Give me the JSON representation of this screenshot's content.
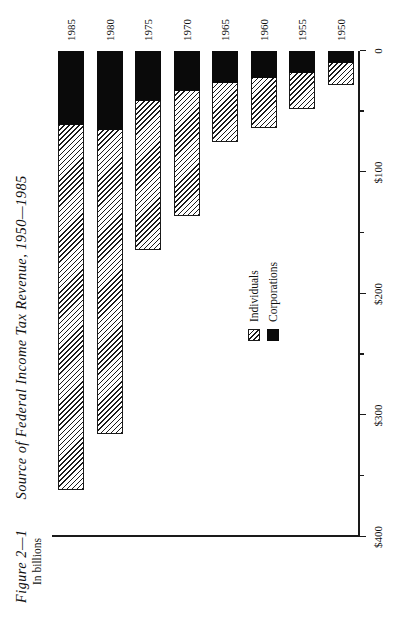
{
  "figure": {
    "number": "Figure 2—1",
    "title": "Source of Federal Income Tax Revenue, 1950—1985",
    "units": "In billions"
  },
  "legend": {
    "position": "inside-left",
    "items": [
      {
        "label": "Individuals",
        "swatch": "hatched-diagonal",
        "color": "#d9d9d9"
      },
      {
        "label": "Corporations",
        "swatch": "solid-black",
        "color": "#0a0a0a"
      }
    ]
  },
  "axis": {
    "value_ticks": [
      "$400",
      "$300",
      "$200",
      "$100",
      "0"
    ],
    "value_tick_numbers": [
      400,
      300,
      200,
      100,
      0
    ],
    "minor_ticks": [
      350,
      250,
      150,
      50
    ]
  },
  "chart_data": {
    "type": "bar",
    "orientation": "horizontal-stacked",
    "title": "Source of Federal Income Tax Revenue, 1950—1985",
    "subtitle": "In billions",
    "xlabel": "",
    "ylabel": "In billions",
    "categories": [
      "1950",
      "1955",
      "1960",
      "1965",
      "1970",
      "1975",
      "1980",
      "1985"
    ],
    "series": [
      {
        "name": "Individuals",
        "values": [
          18,
          30,
          41,
          49,
          103,
          123,
          250,
          300
        ]
      },
      {
        "name": "Corporations",
        "values": [
          10,
          18,
          22,
          26,
          33,
          41,
          65,
          61
        ]
      }
    ],
    "totals": [
      28,
      48,
      63,
      75,
      136,
      164,
      315,
      361
    ],
    "ylim": [
      0,
      400
    ],
    "tick_labels": [
      "$400",
      "$300",
      "$200",
      "$100",
      "0"
    ],
    "grid": false,
    "legend_position": "inside-left"
  }
}
